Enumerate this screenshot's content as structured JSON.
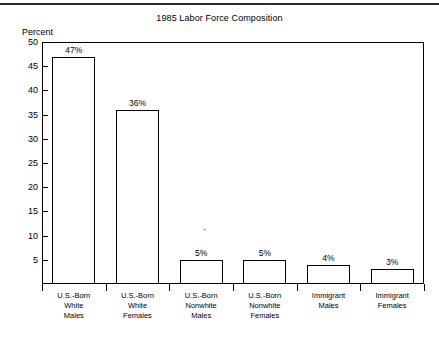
{
  "chart_data": {
    "type": "bar",
    "title": "1985 Labor Force Composition",
    "xlabel": "",
    "ylabel": "Percent",
    "ylim": [
      0,
      50
    ],
    "yticks": [
      5,
      10,
      15,
      20,
      25,
      30,
      35,
      40,
      45,
      50
    ],
    "grid": false,
    "legend": null,
    "categories": [
      "U.S.-Born White Males",
      "U.S.-Born White Females",
      "U.S.-Born Nonwhite Males",
      "U.S.-Born Nonwhite Females",
      "Immigrant Males",
      "Immigrant Females"
    ],
    "category_lines": [
      [
        "U.S.-Born",
        "White",
        "Males"
      ],
      [
        "U.S.-Born",
        "White",
        "Females"
      ],
      [
        "U.S.-Born",
        "Nonwhite",
        "Males"
      ],
      [
        "U.S.-Born",
        "Nonwhite",
        "Females"
      ],
      [
        "Immigrant",
        "Males"
      ],
      [
        "Immigrant",
        "Females"
      ]
    ],
    "values": [
      47,
      36,
      5,
      5,
      4,
      3
    ],
    "value_labels": [
      "47%",
      "36%",
      "5%",
      "5%",
      "4%",
      "3%"
    ],
    "bar_fill": "#ffffff",
    "bar_outline": "#000000"
  }
}
